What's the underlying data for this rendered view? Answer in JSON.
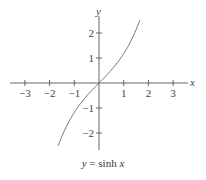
{
  "chart_data": {
    "type": "line",
    "title": "",
    "caption": "y = sinh x",
    "xlabel": "x",
    "ylabel": "y",
    "xlim": [
      -3.6,
      3.6
    ],
    "ylim": [
      -2.6,
      2.6
    ],
    "xticks": [
      -3,
      -2,
      -1,
      1,
      2,
      3
    ],
    "xtick_labels": [
      "−3",
      "−2",
      "−1",
      "1",
      "2",
      "3"
    ],
    "yticks": [
      -2,
      -1,
      1,
      2
    ],
    "ytick_labels": [
      "−2",
      "−1",
      "1",
      "2"
    ],
    "grid": false,
    "series": [
      {
        "name": "sinh x",
        "function": "sinh(x)",
        "x_range": [
          -1.65,
          1.65
        ],
        "x": [
          -1.6,
          -1.2,
          -0.8,
          -0.4,
          0,
          0.4,
          0.8,
          1.2,
          1.6
        ],
        "y": [
          -2.38,
          -1.51,
          -0.89,
          -0.41,
          0,
          0.41,
          0.89,
          1.51,
          2.38
        ]
      }
    ]
  },
  "labels": {
    "x_axis": "x",
    "y_axis": "y",
    "caption_y": "y",
    "caption_eq": " = sinh ",
    "caption_x": "x"
  }
}
